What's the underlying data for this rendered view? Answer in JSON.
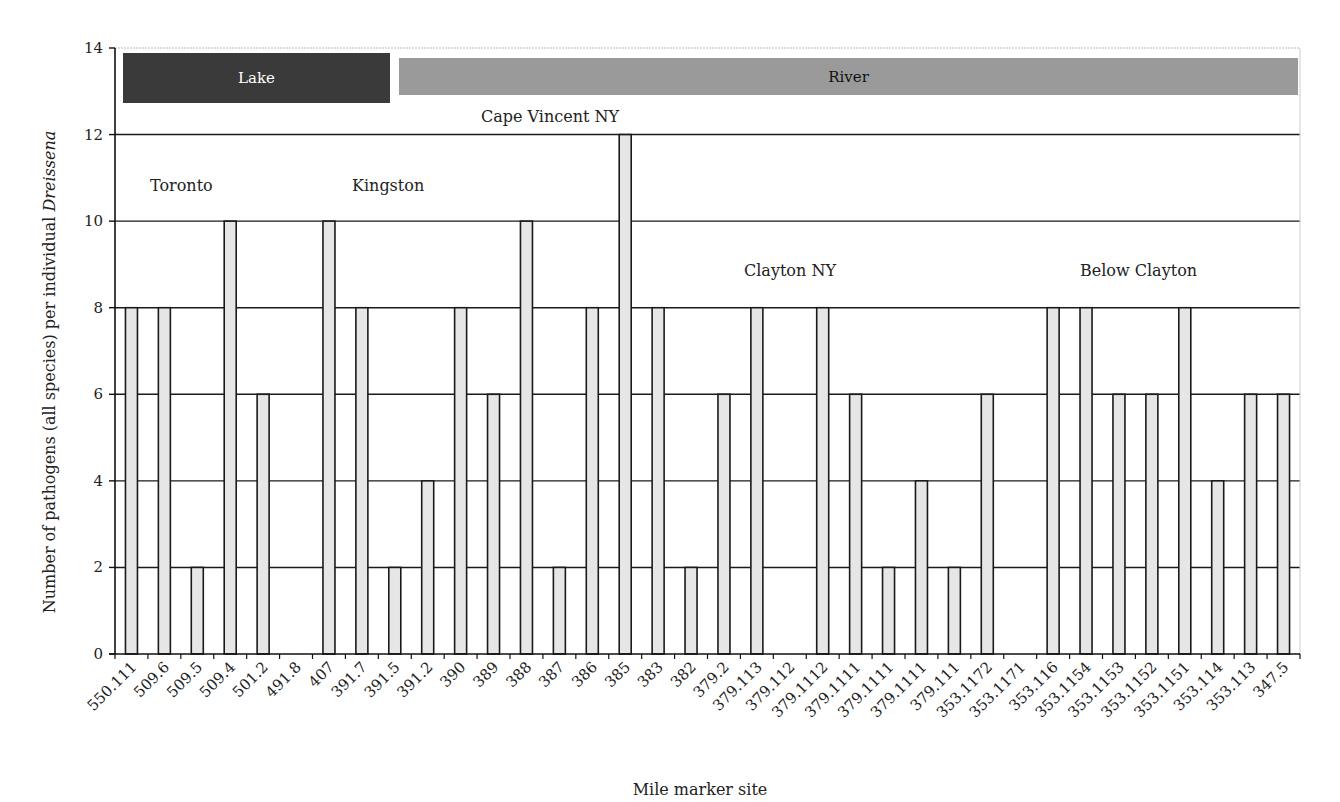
{
  "chart_data": {
    "type": "bar",
    "title": "",
    "xlabel": "Mile marker site",
    "ylabel_prefix": "Number of pathogens (all species) per individual ",
    "ylabel_italic": "Dreissena",
    "ylabel": "Number of pathogens (all species) per individual Dreissena",
    "ylim": [
      0,
      14
    ],
    "yticks": [
      0,
      2,
      4,
      6,
      8,
      10,
      12,
      14
    ],
    "grid": true,
    "legend": null,
    "categories": [
      "550.111",
      "509.6",
      "509.5",
      "509.4",
      "501.2",
      "491.8",
      "407",
      "391.7",
      "391.5",
      "391.2",
      "390",
      "389",
      "388",
      "387",
      "386",
      "385",
      "383",
      "382",
      "379.2",
      "379.113",
      "379.112",
      "379.1112",
      "379.1111",
      "379.1111",
      "379.1111",
      "379.111",
      "353.1172",
      "353.1171",
      "353.116",
      "353.1154",
      "353.1153",
      "353.1152",
      "353.1151",
      "353.114",
      "353.113",
      "347.5"
    ],
    "values": [
      8,
      8,
      2,
      10,
      6,
      0,
      10,
      8,
      2,
      4,
      8,
      6,
      10,
      2,
      8,
      12,
      8,
      2,
      6,
      8,
      0,
      8,
      6,
      2,
      4,
      2,
      6,
      0,
      8,
      8,
      6,
      6,
      8,
      4,
      6,
      6
    ],
    "bands": [
      {
        "label": "Lake",
        "color": "#3a3a3a",
        "text_color": "#ffffff",
        "from_index": 0,
        "to_index": 7
      },
      {
        "label": "River",
        "color": "#9a9a9a",
        "text_color": "#111111",
        "from_index": 8,
        "to_index": 35
      }
    ],
    "annotations": [
      {
        "text": "Toronto",
        "x": 150,
        "y": 191
      },
      {
        "text": "Kingston",
        "x": 352,
        "y": 191
      },
      {
        "text": "Cape Vincent NY",
        "x": 481,
        "y": 122
      },
      {
        "text": "Clayton NY",
        "x": 744,
        "y": 276
      },
      {
        "text": "Below Clayton",
        "x": 1080,
        "y": 276
      }
    ],
    "colors": {
      "bar_fill": "#e6e6e6",
      "bar_stroke": "#1a1a1a",
      "grid": "#1a1a1a"
    }
  }
}
